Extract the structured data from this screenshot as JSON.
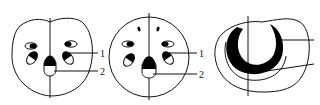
{
  "figures": [
    {
      "id": "a",
      "description": "Cross-section with scattered collateral vascular bundles, flattened top outline",
      "labels": [
        "1",
        "2"
      ]
    },
    {
      "id": "b",
      "description": "Circular cross-section with scattered vascular bundles",
      "labels": [
        "1",
        "2"
      ]
    },
    {
      "id": "c",
      "description": "Cross-section with single crescent-shaped vascular bundle",
      "labels": [
        "1",
        "2"
      ]
    }
  ],
  "colors": {
    "stroke": "#111111",
    "fill_dark": "#000000",
    "background": "#ffffff"
  }
}
